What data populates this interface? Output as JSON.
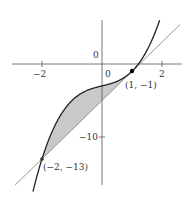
{
  "diagram": {
    "type": "function-graph",
    "curve": {
      "expression": "y = x^3 + x - 3",
      "color": "#222222"
    },
    "line": {
      "expression": "y = 4x - 5",
      "color": "#8a8a8a"
    },
    "shaded_region": {
      "between": "curve and line",
      "x_range": [
        -2,
        1
      ],
      "fill": "#c8c8c8"
    },
    "axes": {
      "x_ticks": [
        {
          "value": -2,
          "label": "−2"
        },
        {
          "value": 0,
          "label": "0"
        },
        {
          "value": 2,
          "label": "2"
        }
      ],
      "y_ticks": [
        {
          "value": 0,
          "label": "0"
        },
        {
          "value": -10,
          "label": "−10"
        }
      ]
    },
    "points": [
      {
        "x": 1,
        "y": -1,
        "label": "(1, −1)"
      },
      {
        "x": -2,
        "y": -13,
        "label": "(−2, −13)"
      }
    ]
  },
  "labels": {
    "origin_x": "0",
    "origin_y": "0",
    "x_neg2": "−2",
    "x_2": "2",
    "y_neg10": "−10",
    "point_a": "(1, −1)",
    "point_b": "(−2, −13)"
  }
}
